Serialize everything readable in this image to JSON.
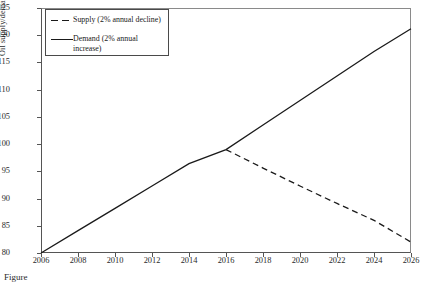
{
  "chart_data": {
    "type": "line",
    "title": "",
    "xlabel": "",
    "ylabel": "Oil supply/demand (million bbl/day)",
    "xlim": [
      2006,
      2026
    ],
    "ylim": [
      80,
      125
    ],
    "ytick_step": 5,
    "xtick_step": 2,
    "grid": false,
    "legend_position": "top-left",
    "xticks": [
      "2006",
      "2008",
      "2010",
      "2012",
      "2014",
      "2016",
      "2018",
      "2020",
      "2022",
      "2024",
      "2026"
    ],
    "yticks": [
      "80",
      "85",
      "90",
      "95",
      "100",
      "105",
      "110",
      "115",
      "120",
      "125"
    ],
    "series": [
      {
        "name": "Supply (2% annual decline)",
        "style": "dashed",
        "color": "#1a1a1a",
        "x": [
          2016,
          2018,
          2020,
          2022,
          2024,
          2026
        ],
        "values": [
          99.0,
          95.6,
          92.3,
          89.1,
          86.0,
          82.0
        ]
      },
      {
        "name": "Demand (2% annual increase)",
        "style": "solid",
        "color": "#1a1a1a",
        "x": [
          2006,
          2008,
          2010,
          2012,
          2014,
          2016,
          2018,
          2020,
          2022,
          2024,
          2026
        ],
        "values": [
          80.0,
          84.1,
          88.2,
          92.3,
          96.4,
          99.0,
          103.5,
          108.0,
          112.5,
          117.0,
          121.2
        ]
      }
    ]
  },
  "legend": {
    "supply_label": "Supply (2% annual decline)",
    "demand_label": "Demand (2% annual increase)"
  },
  "caption": {
    "text": "Figure"
  },
  "colors": {
    "line": "#1a1a1a",
    "axis": "#555555",
    "frame": "#8a8a8a",
    "background": "#ffffff"
  }
}
